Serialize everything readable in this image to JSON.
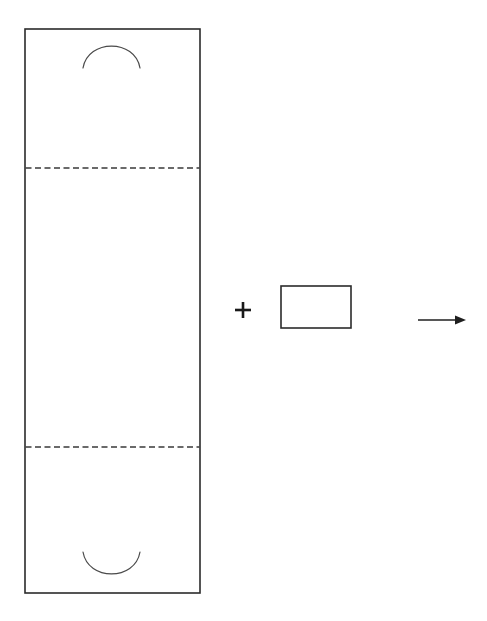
{
  "figure": {
    "title": "Carton blank and insert assembly diagram",
    "background_color": "#ffffff",
    "line_color": "#2b2b2b",
    "dash_color": "#3a3a3a",
    "arc_color": "#4a4a4a",
    "arrow_color": "#1f1f1f",
    "width": 487,
    "height": 621
  },
  "labels": {
    "plus_symbol": "+",
    "arrow_symbol": "→"
  },
  "geometry": {
    "main_panel": {
      "name": "blank-panel",
      "x": 25,
      "y": 29,
      "width": 175,
      "height": 564
    },
    "fold_line_top": {
      "name": "fold-line-upper",
      "x1": 25,
      "x2": 200,
      "y": 168
    },
    "fold_line_bottom": {
      "name": "fold-line-lower",
      "x1": 25,
      "x2": 200,
      "y": 447
    },
    "arc_top": {
      "name": "cutout-arc-top",
      "x_start": 83,
      "x_end": 140,
      "y_ends": 68,
      "y_apex": 46,
      "direction": "convex-up"
    },
    "arc_bottom": {
      "name": "cutout-arc-bottom",
      "x_start": 83,
      "x_end": 140,
      "y_ends": 552,
      "y_apex": 574,
      "direction": "concave-up"
    },
    "plus": {
      "name": "plus-sign",
      "cx": 243,
      "cy": 310,
      "arm": 8,
      "thickness": 2.6
    },
    "insert_rect": {
      "name": "insert-panel",
      "x": 281,
      "y": 286,
      "width": 70,
      "height": 42
    },
    "arrow": {
      "name": "process-arrow",
      "x_start": 418,
      "x_end": 466,
      "y": 320,
      "head_length": 11,
      "head_half_width": 4.5
    }
  }
}
